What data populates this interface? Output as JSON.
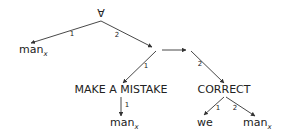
{
  "diagram": {
    "type": "semantic-network",
    "nodes": {
      "root": {
        "label": "∀"
      },
      "man_left": {
        "label": "man",
        "subscript": "x"
      },
      "conj": {
        "label": ""
      },
      "make_mistake": {
        "label": "MAKE A MISTAKE"
      },
      "man_mid": {
        "label": "man",
        "subscript": "x"
      },
      "correct": {
        "label": "CORRECT"
      },
      "we": {
        "label": "we"
      },
      "man_right": {
        "label": "man",
        "subscript": "x"
      }
    },
    "edges": [
      {
        "from": "root",
        "to": "man_left",
        "label": "1"
      },
      {
        "from": "root",
        "to": "conj",
        "label": "2"
      },
      {
        "from": "conj",
        "to": "make_mistake",
        "label": "1"
      },
      {
        "from": "conj",
        "to": "correct",
        "label": "2"
      },
      {
        "from": "conj_left",
        "to": "conj_right",
        "label": ""
      },
      {
        "from": "make_mistake",
        "to": "man_mid",
        "label": "1"
      },
      {
        "from": "correct",
        "to": "we",
        "label": "1"
      },
      {
        "from": "correct",
        "to": "man_right",
        "label": "2"
      }
    ]
  },
  "labels": {
    "root": "∀",
    "man": "man",
    "x": "x",
    "make_mistake": "MAKE A MISTAKE",
    "correct": "CORRECT",
    "we": "we",
    "one": "1",
    "two": "2"
  }
}
